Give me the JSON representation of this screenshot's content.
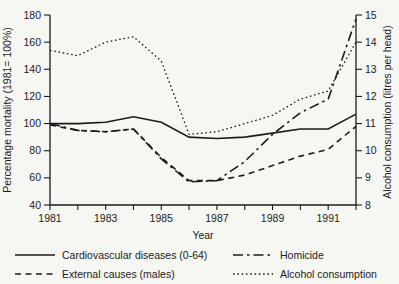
{
  "figure": {
    "background": "#f6f6f3",
    "ink": "#1c1c1c"
  },
  "chart_data": {
    "type": "line",
    "x": [
      1981,
      1982,
      1983,
      1984,
      1985,
      1986,
      1987,
      1988,
      1989,
      1990,
      1991,
      1992
    ],
    "x_tick_labels": [
      "1981",
      "1983",
      "1985",
      "1987",
      "1989",
      "1991"
    ],
    "xlabel": "Year",
    "left_axis": {
      "label": "Percentage mortality (1981= 100%)",
      "ticks": [
        40,
        60,
        80,
        100,
        120,
        140,
        160,
        180
      ],
      "range": [
        40,
        180
      ]
    },
    "right_axis": {
      "label": "Alcohol consumption (litres per head)",
      "ticks": [
        8,
        9,
        10,
        11,
        12,
        13,
        14,
        15
      ],
      "range": [
        8,
        15
      ]
    },
    "grid": "off",
    "legend_position": "below",
    "series": [
      {
        "name": "Cardiovascular diseases (0-64)",
        "axis": "left",
        "style": "solid",
        "values": [
          100,
          100,
          101,
          105,
          101,
          90,
          89,
          90,
          93,
          96,
          96,
          107
        ]
      },
      {
        "name": "External causes (males)",
        "axis": "left",
        "style": "dashed",
        "values": [
          99,
          95,
          94,
          96,
          75,
          58,
          58,
          62,
          69,
          76,
          81,
          98
        ]
      },
      {
        "name": "Homicide",
        "axis": "left",
        "style": "dashdot",
        "values": [
          100,
          95,
          94,
          96,
          74,
          57,
          58,
          72,
          92,
          108,
          118,
          177
        ]
      },
      {
        "name": "Alcohol consumption",
        "axis": "right",
        "style": "dotted",
        "values": [
          13.7,
          13.5,
          14.0,
          14.2,
          13.3,
          10.6,
          10.7,
          11.0,
          11.3,
          11.9,
          12.2,
          14.0
        ]
      }
    ]
  }
}
